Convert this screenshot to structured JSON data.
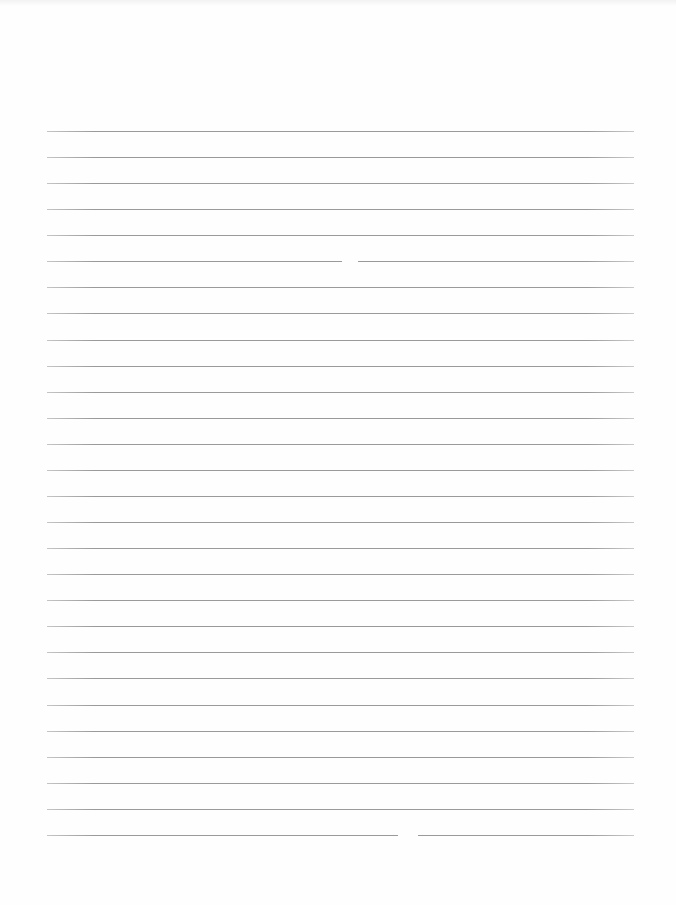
{
  "document": {
    "type": "lined paper",
    "line_count": 28,
    "first_line_y": 131,
    "line_spacing": 26.07,
    "line_left": 47,
    "line_right": 634,
    "line_color": "#9a9a9a",
    "background_color": "#fefefe",
    "gaps": [
      {
        "line_index": 5,
        "x": 342,
        "width": 16
      },
      {
        "line_index": 27,
        "x": 398,
        "width": 20
      }
    ]
  }
}
